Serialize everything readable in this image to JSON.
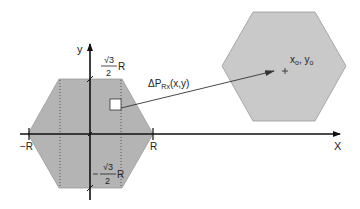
{
  "figure": {
    "axes": {
      "x_label": "X",
      "y_label": "y"
    },
    "left_hexagon": {
      "neg_R_label": "−R",
      "pos_R_label": "R",
      "top_fraction": {
        "numerator": "√3",
        "denominator": "2",
        "suffix": "R"
      },
      "bottom_fraction": {
        "numerator": "√3",
        "denominator": "2",
        "suffix": "R",
        "prefix": "−"
      }
    },
    "element_label": {
      "main": "ΔP",
      "sub": "Rx",
      "args": "(x,y)"
    },
    "right_hexagon": {
      "center_label_x": "x",
      "center_sub_x": "o",
      "sep": ", ",
      "center_label_y": "y",
      "center_sub_y": "o"
    },
    "colors": {
      "hex_fill": "#b4b4b4",
      "right_hex_fill": "#c6c6c6",
      "axis": "#111111",
      "background": "#ffffff"
    }
  }
}
